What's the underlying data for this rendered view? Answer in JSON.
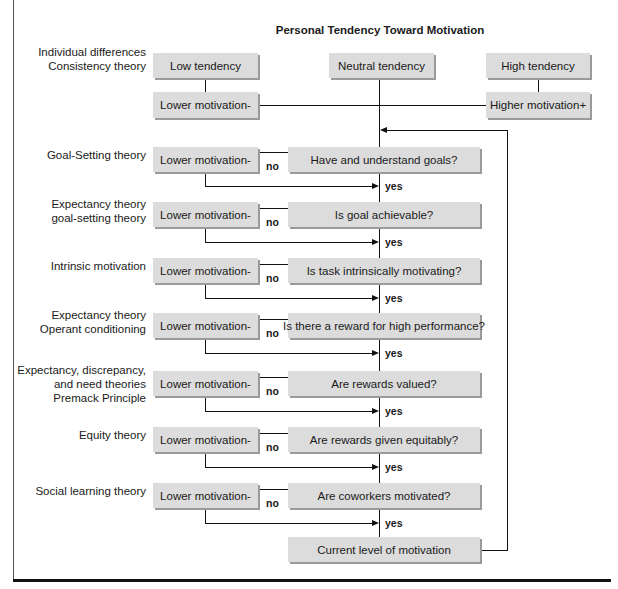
{
  "title": "Personal Tendency Toward Motivation",
  "top_boxes": {
    "low": "Low tendency",
    "neutral": "Neutral tendency",
    "high": "High tendency",
    "lower": "Lower motivation-",
    "higher": "Higher motivation+"
  },
  "top_label": [
    "Individual differences",
    "Consistency theory"
  ],
  "rows": [
    {
      "theory": [
        "Goal-Setting theory"
      ],
      "outcome": "Lower motivation-",
      "question": "Have and understand goals?",
      "no": "no",
      "yes": "yes"
    },
    {
      "theory": [
        "Expectancy theory",
        "goal-setting theory"
      ],
      "outcome": "Lower motivation-",
      "question": "Is goal achievable?",
      "no": "no",
      "yes": "yes"
    },
    {
      "theory": [
        "Intrinsic motivation"
      ],
      "outcome": "Lower motivation-",
      "question": "Is task intrinsically motivating?",
      "no": "no",
      "yes": "yes"
    },
    {
      "theory": [
        "Expectancy theory",
        "Operant conditioning"
      ],
      "outcome": "Lower motivation-",
      "question": "Is there a reward for high performance?",
      "no": "no",
      "yes": "yes"
    },
    {
      "theory": [
        "Expectancy, discrepancy,",
        "and need theories",
        "Premack Principle"
      ],
      "outcome": "Lower motivation-",
      "question": "Are rewards valued?",
      "no": "no",
      "yes": "yes"
    },
    {
      "theory": [
        "Equity theory"
      ],
      "outcome": "Lower motivation-",
      "question": "Are rewards given equitably?",
      "no": "no",
      "yes": "yes"
    },
    {
      "theory": [
        "Social learning theory"
      ],
      "outcome": "Lower motivation-",
      "question": "Are coworkers motivated?",
      "no": "no",
      "yes": "yes"
    }
  ],
  "final_box": "Current level of motivation",
  "colors": {
    "box_fill": "#dcdcdc",
    "box_shadow": "#9a9a9a",
    "line": "#111111"
  }
}
